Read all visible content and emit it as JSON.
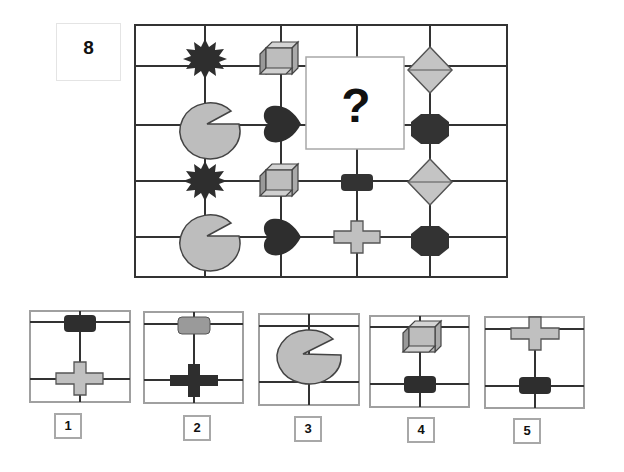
{
  "question": {
    "number": "8",
    "missing_mark": "?"
  },
  "matrix": {
    "rows": [
      [
        "starburst-dark",
        "cube-gray",
        "missing",
        "missing",
        "diamond-gray"
      ],
      [
        "pacman-gray",
        "heart-dark",
        "missing",
        "missing",
        "octagon-dark"
      ],
      [
        "starburst-dark",
        "cube-gray",
        "empty",
        "rounded-rect-dark",
        "diamond-gray"
      ],
      [
        "pacman-gray",
        "heart-dark",
        "empty",
        "cross-gray",
        "octagon-dark"
      ]
    ]
  },
  "options": [
    {
      "label": "1",
      "top": "rounded-rect-dark",
      "bottom": "cross-gray"
    },
    {
      "label": "2",
      "top": "rounded-rect-gray",
      "bottom": "cross-dark"
    },
    {
      "label": "3",
      "top": "pacman-gray",
      "bottom": "none"
    },
    {
      "label": "4",
      "top": "cube-gray",
      "bottom": "rounded-rect-dark"
    },
    {
      "label": "5",
      "top": "cross-gray",
      "bottom": "rounded-rect-dark"
    }
  ],
  "colors": {
    "dark_fill": "#2e2e2e",
    "gray_fill": "#bdbdbd",
    "gray_mid": "#9a9a9a",
    "line": "#333333",
    "frame_gray": "#a0a0a0"
  }
}
